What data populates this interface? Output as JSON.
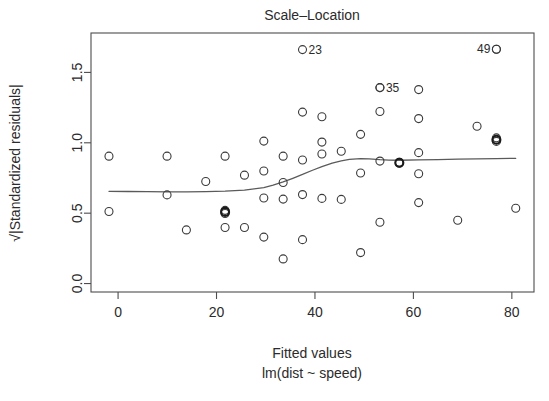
{
  "chart_data": {
    "type": "scatter",
    "title": "Scale–Location",
    "xlabel": "Fitted values",
    "xlabel_sub": "lm(dist ~ speed)",
    "ylabel": "√|Standardized residuals|",
    "grid": false,
    "legend": "none",
    "xlim": [
      -5.5,
      84.5
    ],
    "ylim": [
      -0.06,
      1.78
    ],
    "xticks": [
      0,
      20,
      40,
      60,
      80
    ],
    "xtick_labels": [
      "0",
      "20",
      "40",
      "60",
      "80"
    ],
    "yticks": [
      0.0,
      0.5,
      1.0,
      1.5
    ],
    "ytick_labels": [
      "0.0",
      "0.5",
      "1.0",
      "1.5"
    ],
    "series": [
      {
        "name": "observations",
        "x": [
          -1.85,
          -1.85,
          9.95,
          9.95,
          13.88,
          17.81,
          21.74,
          21.74,
          21.74,
          21.74,
          25.68,
          25.68,
          29.61,
          29.61,
          29.61,
          29.61,
          33.54,
          33.54,
          33.54,
          33.54,
          37.47,
          37.47,
          37.47,
          37.47,
          41.41,
          41.41,
          41.41,
          41.41,
          45.34,
          45.34,
          49.27,
          49.27,
          49.27,
          53.2,
          53.2,
          53.2,
          53.2,
          57.14,
          57.14,
          61.07,
          61.07,
          61.07,
          61.07,
          61.07,
          69.0,
          72.93,
          76.86,
          76.86,
          76.86,
          80.79
        ],
        "y": [
          0.905,
          0.512,
          0.905,
          0.63,
          0.381,
          0.725,
          0.905,
          0.52,
          0.498,
          0.398,
          0.77,
          0.398,
          1.012,
          0.8,
          0.608,
          0.33,
          0.905,
          0.718,
          0.6,
          0.175,
          1.218,
          0.878,
          0.632,
          0.312,
          1.185,
          1.005,
          0.92,
          0.605,
          0.94,
          0.598,
          1.06,
          0.785,
          0.22,
          1.392,
          1.222,
          0.87,
          0.435,
          0.862,
          0.855,
          1.378,
          1.172,
          0.93,
          0.78,
          0.575,
          0.45,
          1.118,
          1.665,
          1.035,
          1.01,
          0.535
        ],
        "marker": "open-circle",
        "marker_size": 4.0
      }
    ],
    "overplotted_points": [
      {
        "x": 57.14,
        "y": 0.858
      },
      {
        "x": 21.74,
        "y": 0.509
      },
      {
        "x": 76.86,
        "y": 1.022
      }
    ],
    "annotations": [
      {
        "label": "23",
        "x": 37.47,
        "y": 1.662,
        "label_side": "right"
      },
      {
        "label": "35",
        "x": 53.2,
        "y": 1.392,
        "label_side": "right"
      },
      {
        "label": "49",
        "x": 76.86,
        "y": 1.665,
        "label_side": "left"
      }
    ],
    "smooth_line": {
      "name": "lowess",
      "x": [
        -1.85,
        2.0,
        6.0,
        9.95,
        13.88,
        17.81,
        21.74,
        25.68,
        29.61,
        31.5,
        33.54,
        35.5,
        37.47,
        39.5,
        41.41,
        43.5,
        45.34,
        47.0,
        49.27,
        51.0,
        53.2,
        55.0,
        57.14,
        61.07,
        65.0,
        69.0,
        72.93,
        76.86,
        80.79
      ],
      "y": [
        0.655,
        0.654,
        0.653,
        0.652,
        0.652,
        0.653,
        0.656,
        0.664,
        0.682,
        0.7,
        0.722,
        0.748,
        0.775,
        0.805,
        0.83,
        0.855,
        0.872,
        0.882,
        0.888,
        0.886,
        0.88,
        0.877,
        0.876,
        0.878,
        0.881,
        0.884,
        0.886,
        0.888,
        0.89
      ]
    }
  },
  "plot_box": {
    "left": 91,
    "right": 534,
    "top": 33,
    "bottom": 292
  },
  "colors": {
    "point_stroke": "#3a3a3a",
    "line_stroke": "#5a5a5a",
    "axis": "#4d4d4d",
    "text": "#2b2b2b",
    "background": "#ffffff"
  }
}
